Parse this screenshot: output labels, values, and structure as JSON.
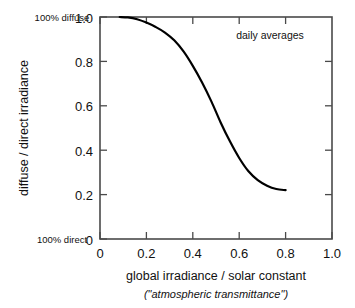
{
  "chart_data": {
    "type": "line",
    "title": "",
    "xlabel": "global irradiance / solar constant",
    "xlabel_sub": "(\"atmospheric transmittance\")",
    "ylabel": "diffuse / direct irradiance",
    "xlim": [
      0,
      1.0
    ],
    "ylim": [
      0,
      1.0
    ],
    "grid": false,
    "legend": "none",
    "xticks": [
      "0",
      "0.2",
      "0.4",
      "0.6",
      "0.8",
      "1.0"
    ],
    "xtick_values": [
      0,
      0.2,
      0.4,
      0.6,
      0.8,
      1.0
    ],
    "yticks": [
      "0",
      "0.2",
      "0.4",
      "0.6",
      "0.8",
      "1.0"
    ],
    "ytick_values": [
      0,
      0.2,
      0.4,
      0.6,
      0.8,
      1.0
    ],
    "annotations": [
      {
        "text": "daily averages",
        "x": 0.62,
        "y": 0.91
      },
      {
        "text": "100% diffuse",
        "x": 0.0,
        "y": 1.0,
        "placement": "left-of-axis-top"
      },
      {
        "text": "100% direct",
        "x": 0.0,
        "y": 0.0,
        "placement": "left-of-axis-bottom"
      }
    ],
    "series": [
      {
        "name": "diffuse / direct irradiance",
        "x": [
          0.085,
          0.12,
          0.16,
          0.2,
          0.24,
          0.28,
          0.32,
          0.36,
          0.4,
          0.44,
          0.48,
          0.52,
          0.56,
          0.6,
          0.64,
          0.68,
          0.72,
          0.76,
          0.8
        ],
        "y": [
          1.0,
          0.998,
          0.99,
          0.975,
          0.955,
          0.93,
          0.895,
          0.845,
          0.78,
          0.705,
          0.62,
          0.525,
          0.44,
          0.365,
          0.305,
          0.265,
          0.24,
          0.225,
          0.22
        ]
      }
    ]
  },
  "labels": {
    "top_left_corner": "100% diffuse",
    "bottom_left_corner": "100% direct",
    "annotation": "daily averages",
    "x_axis_title": "global irradiance / solar constant",
    "x_axis_subtitle": "(\"atmospheric transmittance\")",
    "y_axis_title": "diffuse / direct irradiance"
  },
  "colors": {
    "curve": "#000000",
    "frame": "#4a4a4a",
    "text": "#111111",
    "background": "#ffffff"
  }
}
